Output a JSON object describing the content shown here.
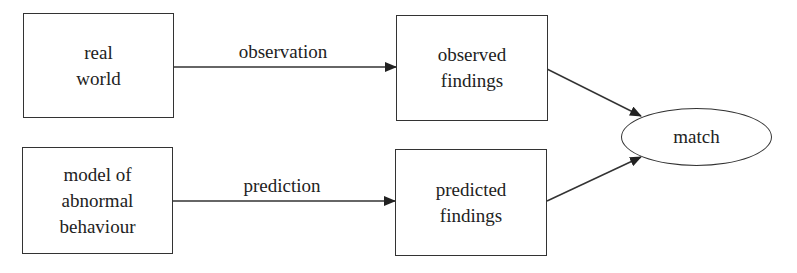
{
  "diagram": {
    "nodes": [
      {
        "id": "real_world",
        "shape": "rect",
        "lines": [
          "real",
          "world"
        ]
      },
      {
        "id": "model",
        "shape": "rect",
        "lines": [
          "model of",
          "abnormal",
          "behaviour"
        ]
      },
      {
        "id": "observed",
        "shape": "rect",
        "lines": [
          "observed",
          "findings"
        ]
      },
      {
        "id": "predicted",
        "shape": "rect",
        "lines": [
          "predicted",
          "findings"
        ]
      },
      {
        "id": "match",
        "shape": "ellipse",
        "lines": [
          "match"
        ]
      }
    ],
    "edges": [
      {
        "from": "real_world",
        "to": "observed",
        "label": "observation"
      },
      {
        "from": "model",
        "to": "predicted",
        "label": "prediction"
      },
      {
        "from": "observed",
        "to": "match",
        "label": ""
      },
      {
        "from": "predicted",
        "to": "match",
        "label": ""
      }
    ],
    "colors": {
      "stroke": "#333333",
      "background": "#ffffff",
      "text": "#222222"
    }
  }
}
